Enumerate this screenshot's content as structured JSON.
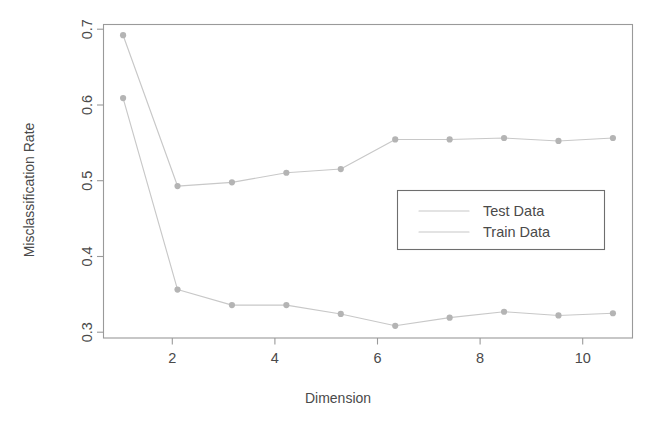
{
  "chart_data": {
    "type": "line",
    "title": "",
    "xlabel": "Dimension",
    "ylabel": "Misclassification Rate",
    "x": [
      1,
      2,
      3,
      4,
      5,
      6,
      7,
      8,
      9,
      10
    ],
    "series": [
      {
        "name": "Test Data",
        "values": [
          0.695,
          0.491,
          0.496,
          0.509,
          0.514,
          0.554,
          0.554,
          0.556,
          0.552,
          0.556
        ],
        "color": "#c8c8c8"
      },
      {
        "name": "Train Data",
        "values": [
          0.61,
          0.351,
          0.33,
          0.33,
          0.318,
          0.302,
          0.313,
          0.321,
          0.316,
          0.319
        ],
        "color": "#c8c8c8"
      }
    ],
    "xlim": [
      0.64,
      10.36
    ],
    "ylim": [
      0.2855,
      0.7095
    ],
    "xticks": [
      2,
      4,
      6,
      8,
      10
    ],
    "xtick_labels": [
      "2",
      "4",
      "6",
      "8",
      "10"
    ],
    "yticks": [
      0.3,
      0.4,
      0.5,
      0.6,
      0.7
    ],
    "ytick_labels": [
      "0.3",
      "0.4",
      "0.5",
      "0.6",
      "0.7"
    ],
    "grid": false,
    "legend_position": "center-right",
    "legend_entries": [
      "Test Data",
      "Train Data"
    ],
    "marker": "circle",
    "frame_color": "#9a9a9a",
    "text_color": "#4a4a4a"
  },
  "axes": {
    "x_title": "Dimension",
    "y_title": "Misclassification Rate"
  },
  "legend": {
    "entries": [
      {
        "label": "Test Data"
      },
      {
        "label": "Train Data"
      }
    ]
  },
  "ticks": {
    "x": [
      "2",
      "4",
      "6",
      "8",
      "10"
    ],
    "y": [
      "0.3",
      "0.4",
      "0.5",
      "0.6",
      "0.7"
    ]
  }
}
